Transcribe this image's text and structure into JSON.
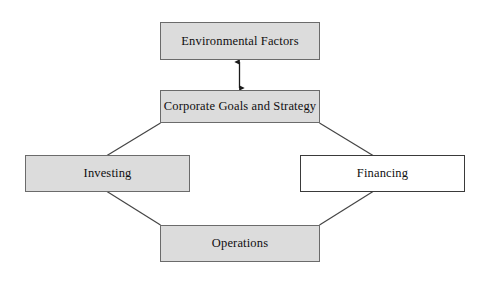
{
  "diagram": {
    "type": "flow-diagram",
    "background_color": "#ffffff",
    "nodes": [
      {
        "id": "environmental-factors",
        "label": "Environmental Factors",
        "fill": "#dcdcdc",
        "border": "#6b6b6b"
      },
      {
        "id": "corporate-goals",
        "label": "Corporate Goals and Strategy",
        "fill": "#dcdcdc",
        "border": "#6b6b6b"
      },
      {
        "id": "investing",
        "label": "Investing",
        "fill": "#dcdcdc",
        "border": "#6b6b6b"
      },
      {
        "id": "financing",
        "label": "Financing",
        "fill": "#ffffff",
        "border": "#3a3a3a"
      },
      {
        "id": "operations",
        "label": "Operations",
        "fill": "#dcdcdc",
        "border": "#6b6b6b"
      }
    ],
    "connectors": [
      {
        "id": "env-to-goals",
        "from": "environmental-factors",
        "to": "corporate-goals",
        "style": "double-headed-arrow",
        "orientation": "vertical"
      },
      {
        "id": "goals-to-investing",
        "from": "corporate-goals",
        "to": "investing",
        "style": "line",
        "orientation": "diagonal"
      },
      {
        "id": "goals-to-financing",
        "from": "corporate-goals",
        "to": "financing",
        "style": "line",
        "orientation": "diagonal"
      },
      {
        "id": "investing-to-operations",
        "from": "investing",
        "to": "operations",
        "style": "line",
        "orientation": "diagonal"
      },
      {
        "id": "financing-to-operations",
        "from": "financing",
        "to": "operations",
        "style": "line",
        "orientation": "diagonal"
      }
    ],
    "line_color": "#444444"
  }
}
